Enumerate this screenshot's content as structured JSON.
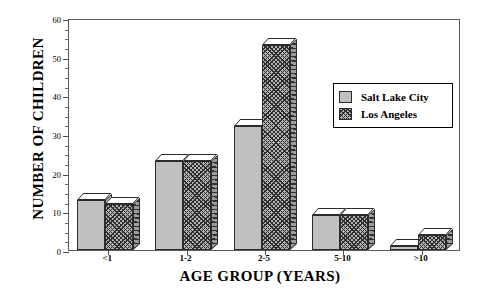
{
  "chart_data": {
    "type": "bar",
    "title": "",
    "xlabel": "AGE GROUP (YEARS)",
    "ylabel": "NUMBER OF CHILDREN",
    "categories": [
      "<1",
      "1-2",
      "2-5",
      "5-10",
      ">10"
    ],
    "series": [
      {
        "name": "Salt Lake City",
        "values": [
          13,
          23,
          32,
          9,
          1
        ],
        "color": "#c0c0c0",
        "pattern": "solid"
      },
      {
        "name": "Los Angeles",
        "values": [
          12,
          23,
          53,
          9,
          4
        ],
        "color": "#b4b4b4",
        "pattern": "cross-hatch"
      }
    ],
    "ylim": [
      0,
      60
    ],
    "yticks": [
      0,
      10,
      20,
      30,
      40,
      50,
      60
    ],
    "ytick_labels": [
      "0",
      "10",
      "20",
      "30",
      "40",
      "50",
      "60"
    ],
    "yminor_step": 2.5,
    "grid": false,
    "legend_position": "upper right",
    "legend_entries": [
      "Salt Lake City",
      "Los Angeles"
    ]
  }
}
